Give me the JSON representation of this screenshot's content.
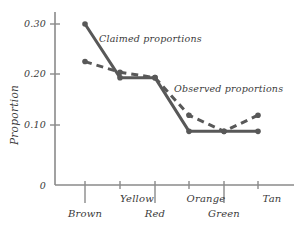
{
  "chart_data": {
    "type": "line",
    "title": "",
    "xlabel": "",
    "ylabel": "Proportion",
    "categories": [
      "Brown",
      "Yellow",
      "Red",
      "Orange",
      "Green",
      "Tan"
    ],
    "ylim": [
      0,
      0.32
    ],
    "ytick_labels": [
      "0",
      "0.10",
      "0.20",
      "0.30"
    ],
    "ytick_values": [
      0,
      0.1,
      0.2,
      0.3
    ],
    "grid": false,
    "legend_position": "inline-annotations",
    "series": [
      {
        "name": "Claimed proportions",
        "style": "solid",
        "color": "#585858",
        "values": [
          0.3,
          0.2,
          0.2,
          0.1,
          0.1,
          0.1
        ]
      },
      {
        "name": "Observed proportions",
        "style": "dashed",
        "color": "#585858",
        "values": [
          0.23,
          0.21,
          0.2,
          0.13,
          0.1,
          0.13
        ]
      }
    ],
    "annotations": [
      {
        "text": "Claimed proportions",
        "series": "Claimed proportions"
      },
      {
        "text": "Observed proportions",
        "series": "Observed proportions"
      }
    ]
  },
  "axis": {
    "y_title": "Proportion",
    "y_ticks": [
      "0.30",
      "0.20",
      "0.10",
      "0"
    ],
    "x_categories_top_row": [
      "Yellow",
      "Orange",
      "Tan"
    ],
    "x_categories_bottom_row": [
      "Brown",
      "Red",
      "Green"
    ]
  },
  "labels": {
    "claimed": "Claimed proportions",
    "observed": "Observed proportions",
    "y_axis_title": "Proportion",
    "y_tick_030": "0.30",
    "y_tick_020": "0.20",
    "y_tick_010": "0.10",
    "y_tick_0": "0",
    "cat_brown": "Brown",
    "cat_yellow": "Yellow",
    "cat_red": "Red",
    "cat_orange": "Orange",
    "cat_green": "Green",
    "cat_tan": "Tan"
  },
  "colors": {
    "series": "#585858",
    "axis": "#8a8a8a",
    "text": "#3a3a3a",
    "background": "#ffffff"
  }
}
